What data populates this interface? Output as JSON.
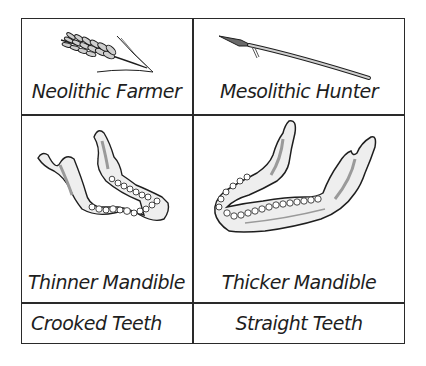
{
  "diagram": {
    "columns": [
      {
        "header": {
          "label": "Neolithic Farmer",
          "icon": "wheat-icon"
        },
        "mandible": {
          "label": "Thinner Mandible",
          "icon": "thin-mandible-icon"
        },
        "teeth": {
          "label": "Crooked Teeth"
        }
      },
      {
        "header": {
          "label": "Mesolithic Hunter",
          "icon": "spear-icon"
        },
        "mandible": {
          "label": "Thicker Mandible",
          "icon": "thick-mandible-icon"
        },
        "teeth": {
          "label": "Straight Teeth"
        }
      }
    ],
    "colors": {
      "line": "#2a2a2a",
      "ink": "#1e1e1e",
      "shade": "#9a9a9a",
      "background": "#ffffff"
    }
  }
}
